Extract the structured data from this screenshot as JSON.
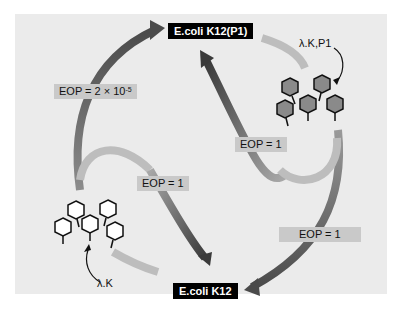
{
  "diagram": {
    "hosts": {
      "top": "E.coli K12(P1)",
      "bottom": "E.coli K12"
    },
    "eop_labels": {
      "left_outer": "EOP = 2 × 10",
      "left_outer_exp": "-5",
      "center_left": "EOP = 1",
      "center_right": "EOP = 1",
      "right_outer": "EOP = 1"
    },
    "phage_labels": {
      "top_right": "λ.K,P1",
      "bottom_left": "λ.K"
    },
    "colors": {
      "panel_bg": "#ebebeb",
      "arrow_dark": "#4a4a4a",
      "arrow_light": "#b8b8b8",
      "host_label_bg": "#000000",
      "eop_label_bg": "#c9c9c9",
      "phage_filled": "#8a8a8a",
      "phage_empty": "#ffffff"
    }
  }
}
